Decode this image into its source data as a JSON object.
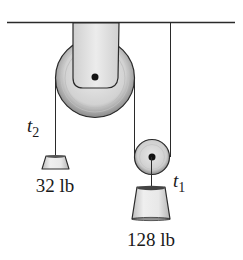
{
  "diagram": {
    "type": "pulley-system",
    "labels": {
      "tension_left": {
        "main": "t",
        "sub": "2"
      },
      "tension_right": {
        "main": "t",
        "sub": "1"
      },
      "weight_small": "32 lb",
      "weight_large": "128 lb"
    },
    "components": {
      "ceiling": "ceiling",
      "fixed_pulley": "fixed pulley (large)",
      "movable_pulley": "movable pulley (small)",
      "weight_small": "32 lb weight",
      "weight_large": "128 lb weight"
    },
    "colors": {
      "line": "#2a2a2a",
      "pulley_fill": "#d6d6d6",
      "bracket_fill": "#e4e4e4",
      "weight_fill": "#e6e6e6"
    }
  }
}
